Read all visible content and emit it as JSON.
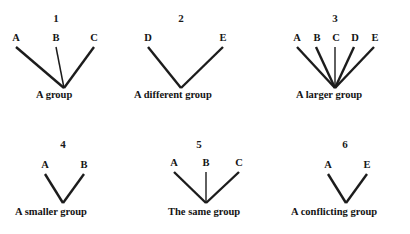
{
  "figure": {
    "type": "tree-diagram-set",
    "background_color": "#ffffff",
    "line_color": "#1c1c1c",
    "text_color": "#141414",
    "panel_count": 6
  },
  "panels": [
    {
      "number": "1",
      "caption": "A group",
      "leaves": [
        "A",
        "B",
        "C"
      ],
      "leaf_count": 3
    },
    {
      "number": "2",
      "caption": "A different group",
      "leaves": [
        "D",
        "E"
      ],
      "leaf_count": 2
    },
    {
      "number": "3",
      "caption": "A larger group",
      "leaves": [
        "A",
        "B",
        "C",
        "D",
        "E"
      ],
      "leaf_count": 5
    },
    {
      "number": "4",
      "caption": "A smaller group",
      "leaves": [
        "A",
        "B"
      ],
      "leaf_count": 2
    },
    {
      "number": "5",
      "caption": "The same group",
      "leaves": [
        "A",
        "B",
        "C"
      ],
      "leaf_count": 3
    },
    {
      "number": "6",
      "caption": "A conflicting group",
      "leaves": [
        "A",
        "E"
      ],
      "leaf_count": 2
    }
  ]
}
